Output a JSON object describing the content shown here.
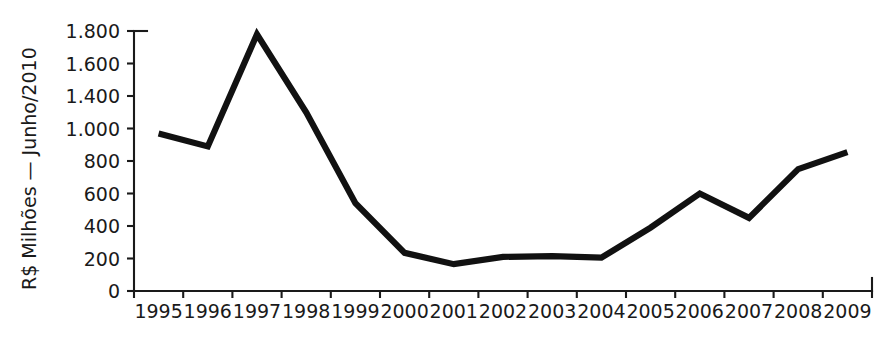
{
  "chart_data": {
    "type": "line",
    "title": "",
    "subtitle": "",
    "xlabel": "",
    "ylabel": "R$ Milhões — Junho/2010",
    "categories": [
      "1995",
      "1996",
      "1997",
      "1998",
      "1999",
      "2000",
      "2001",
      "2002",
      "2003",
      "2004",
      "2005",
      "2006",
      "2007",
      "2008",
      "2009"
    ],
    "series": [
      {
        "name": "R$ Milhões — Junho/2010",
        "color": "#111111",
        "values": [
          970,
          890,
          1580,
          1100,
          540,
          235,
          165,
          210,
          215,
          205,
          390,
          600,
          450,
          750,
          855
        ]
      }
    ],
    "y_tick_labels": [
      "0",
      "200",
      "400",
      "600",
      "800",
      "1.000",
      "1.400",
      "1.600",
      "1.800"
    ],
    "y_tick_values": [
      0,
      200,
      400,
      600,
      800,
      1000,
      1400,
      1600,
      1800
    ],
    "x_tick_labels": [
      "1995",
      "1996",
      "1997",
      "1998",
      "1999",
      "2000",
      "2001",
      "2002",
      "2003",
      "2004",
      "2005",
      "2006",
      "2007",
      "2008",
      "2009"
    ],
    "ylim": [
      0,
      1800
    ],
    "grid": false,
    "legend": false,
    "legend_position": "none",
    "annotations": []
  },
  "axis": {
    "y_title": "R$ Milhões — Junho/2010",
    "line_color": "#1a1a1a",
    "text_color": "#1a1a1a"
  }
}
